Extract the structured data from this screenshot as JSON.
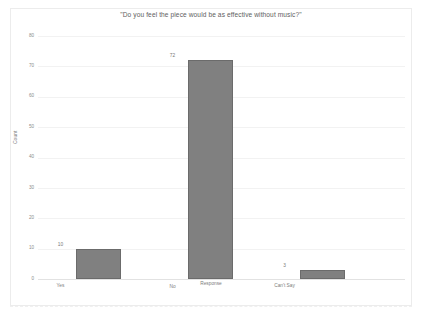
{
  "chart_data": {
    "type": "bar",
    "title": "\"Do you feel the piece would be as effective without music?\"",
    "xlabel": "Response",
    "ylabel": "Count",
    "categories": [
      "Yes",
      "No",
      "Can't Say"
    ],
    "values": [
      10,
      72,
      3
    ],
    "value_labels": [
      "10",
      "72",
      "3"
    ],
    "ylim": [
      0,
      80
    ],
    "yticks": [
      0,
      10,
      20,
      30,
      40,
      50,
      60,
      70,
      80
    ],
    "ytick_labels": [
      "0",
      "10",
      "20",
      "30",
      "40",
      "50",
      "60",
      "70",
      "80"
    ],
    "grid": true,
    "legend": "none",
    "bar_color": "#808080",
    "bar_border_color": "#6b6b6b",
    "grid_color": "#f2f2f2",
    "background": "#ffffff"
  }
}
